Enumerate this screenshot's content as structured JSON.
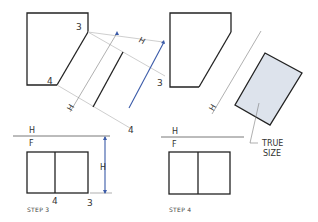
{
  "colors": {
    "edge": "#222222",
    "construction": "#c8c8c8",
    "dimension": "#3a5aa8",
    "true_size_fill": "#dde3ec"
  },
  "step3": {
    "top_view": {
      "point_labels": [
        "3",
        "4"
      ]
    },
    "auxiliary": {
      "dim_labels": [
        "H",
        "H"
      ],
      "point_labels": [
        "3",
        "4"
      ]
    },
    "reference_line": {
      "upper": "H",
      "lower": "F"
    },
    "front_view": {
      "dim_label": "H",
      "point_labels": [
        "4",
        "3"
      ]
    },
    "caption": "STEP 3"
  },
  "step4": {
    "auxiliary": {
      "dim_label": "H"
    },
    "reference_line": {
      "upper": "H",
      "lower": "F"
    },
    "callout": {
      "line1": "TRUE",
      "line2": "SIZE"
    },
    "caption": "STEP 4"
  }
}
